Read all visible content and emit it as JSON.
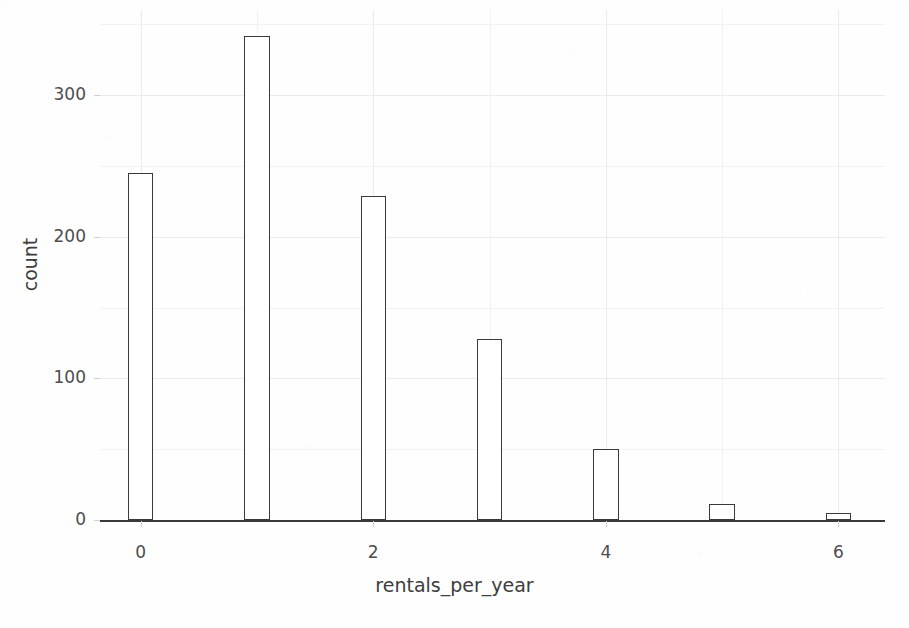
{
  "chart_data": {
    "type": "bar",
    "title": "",
    "subtitle": "",
    "xlabel": "rentals_per_year",
    "ylabel": "count",
    "categories": [
      0,
      1,
      2,
      3,
      4,
      5,
      6
    ],
    "values": [
      245,
      342,
      229,
      128,
      50,
      11,
      5
    ],
    "series": [
      {
        "name": "count",
        "values": [
          245,
          342,
          229,
          128,
          50,
          11,
          5
        ]
      }
    ],
    "bar_width_units": 0.22,
    "xlim": [
      -0.35,
      6.4
    ],
    "ylim": [
      0,
      360
    ],
    "x_ticks": [
      0,
      2,
      4,
      6
    ],
    "x_tick_labels": [
      "0",
      "2",
      "4",
      "6"
    ],
    "y_ticks": [
      0,
      100,
      200,
      300
    ],
    "y_tick_labels": [
      "0",
      "100",
      "200",
      "300"
    ],
    "y_minor_ticks": [
      50,
      150,
      250,
      350
    ],
    "x_minor_ticks": [
      1,
      3,
      5
    ],
    "grid": true,
    "grid_major_color": "#ebebeb",
    "grid_minor_color": "#f2f2f2",
    "legend": null,
    "legend_position": "none",
    "bar_fill_color": "#ffffff",
    "bar_border_color": "#3a3a3a",
    "background_color": "#fefefe",
    "axis_text_color": "#4d4d4d",
    "axis_title_color": "#3d3d3d",
    "annotations": []
  },
  "figure": {
    "width": 909,
    "height": 628
  }
}
